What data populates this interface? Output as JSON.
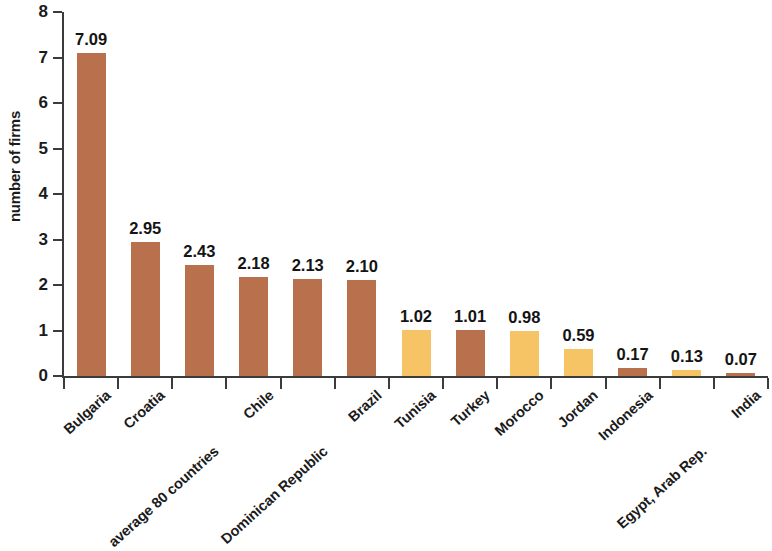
{
  "chart_data": {
    "type": "bar",
    "title": "",
    "subtitle": "",
    "xlabel": "",
    "ylabel": "number of firms",
    "ylim": [
      0,
      8
    ],
    "ytick_labels": [
      "0",
      "1",
      "2",
      "3",
      "4",
      "5",
      "6",
      "7",
      "8"
    ],
    "yticks": [
      0,
      1,
      2,
      3,
      4,
      5,
      6,
      7,
      8
    ],
    "grid": false,
    "legend": "none",
    "categories": [
      "Bulgaria",
      "Croatia",
      "average 80 countries",
      "Chile",
      "Dominican Republic",
      "Brazil",
      "Tunisia",
      "Turkey",
      "Morocco",
      "Jordan",
      "Indonesia",
      "Egypt, Arab Rep.",
      "India"
    ],
    "values": [
      7.09,
      2.95,
      2.43,
      2.18,
      2.13,
      2.1,
      1.02,
      1.01,
      0.98,
      0.59,
      0.17,
      0.13,
      0.07
    ],
    "value_labels": [
      "7.09",
      "2.95",
      "2.43",
      "2.18",
      "2.13",
      "2.10",
      "1.02",
      "1.01",
      "0.98",
      "0.59",
      "0.17",
      "0.13",
      "0.07"
    ],
    "bar_colors": [
      "#b9714d",
      "#b9714d",
      "#b9714d",
      "#b9714d",
      "#b9714d",
      "#b9714d",
      "#f6c464",
      "#b9714d",
      "#f6c464",
      "#f6c464",
      "#b9714d",
      "#f6c464",
      "#b9714d"
    ],
    "color_names": [
      "brown",
      "brown",
      "brown",
      "brown",
      "brown",
      "brown",
      "yellow",
      "brown",
      "yellow",
      "yellow",
      "brown",
      "yellow",
      "brown"
    ],
    "label_row": [
      0,
      0,
      1,
      0,
      1,
      0,
      0,
      0,
      0,
      0,
      0,
      1,
      0
    ],
    "palette": {
      "brown": "#b9714d",
      "yellow": "#f6c464",
      "axis": "#3b3b3b",
      "text": "#1b1b1b",
      "background": "#ffffff"
    }
  }
}
